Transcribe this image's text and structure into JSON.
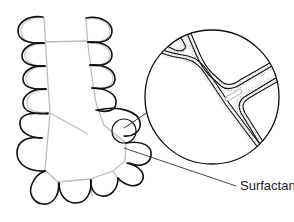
{
  "diagram": {
    "type": "anatomical-illustration",
    "labels": [
      {
        "id": "surfactant",
        "text": "Surfactant"
      }
    ],
    "colors": {
      "outline": "#111111",
      "septa": "#b8b8b8",
      "surfactant_stipple": "#9a9a9a",
      "background": "#ffffff"
    }
  }
}
